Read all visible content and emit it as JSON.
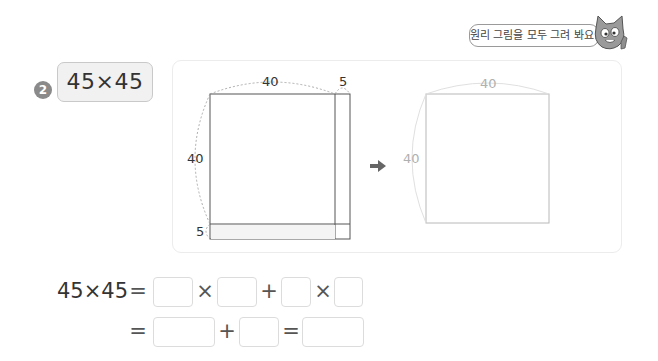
{
  "problem": {
    "number": "2",
    "expression": "45×45"
  },
  "speech_bubble": {
    "text": "원리 그림을 모두 그려 봐요!"
  },
  "left_figure": {
    "top_labels": [
      "40",
      "5"
    ],
    "side_labels": [
      "40",
      "5"
    ]
  },
  "right_figure": {
    "top_label": "40",
    "side_label": "40"
  },
  "equation": {
    "line1": {
      "lhs": "45×45",
      "equals": "=",
      "times1": "×",
      "plus": "+",
      "times2": "×"
    },
    "line2": {
      "equals1": "=",
      "plus": "+",
      "equals2": "="
    },
    "blanks": [
      "",
      "",
      "",
      "",
      "",
      "",
      ""
    ]
  },
  "colors": {
    "badge": "#8a8a8a",
    "problem_bg": "#f1f1f1",
    "panel_border": "#ececec",
    "guide_gray": "#b0b0b0",
    "arrow": "#666666"
  }
}
